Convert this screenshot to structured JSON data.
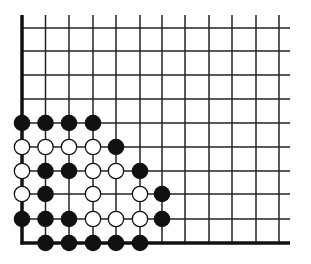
{
  "board": {
    "description": "Go board diagram, lower-left corner section",
    "columns": 12,
    "rows": 10,
    "col_x": [
      22,
      45.5,
      69,
      93,
      116,
      140,
      162,
      185,
      209,
      232,
      256,
      279
    ],
    "row_y": [
      28,
      51,
      75,
      99,
      123,
      147,
      171,
      194,
      219,
      243
    ],
    "line_top": 15,
    "line_right": 290,
    "edges": {
      "left": true,
      "bottom": true,
      "top": false,
      "right": false
    },
    "line_color": "#222222",
    "edge_color": "#111111",
    "stone_radius": 8.3
  },
  "stones": [
    {
      "color": "black",
      "col": 0,
      "row": 4
    },
    {
      "color": "black",
      "col": 1,
      "row": 4
    },
    {
      "color": "black",
      "col": 2,
      "row": 4
    },
    {
      "color": "black",
      "col": 3,
      "row": 4
    },
    {
      "color": "white",
      "col": 0,
      "row": 5
    },
    {
      "color": "white",
      "col": 1,
      "row": 5
    },
    {
      "color": "white",
      "col": 2,
      "row": 5
    },
    {
      "color": "white",
      "col": 3,
      "row": 5
    },
    {
      "color": "black",
      "col": 4,
      "row": 5
    },
    {
      "color": "white",
      "col": 0,
      "row": 6
    },
    {
      "color": "black",
      "col": 1,
      "row": 6
    },
    {
      "color": "black",
      "col": 2,
      "row": 6
    },
    {
      "color": "white",
      "col": 3,
      "row": 6
    },
    {
      "color": "white",
      "col": 4,
      "row": 6
    },
    {
      "color": "black",
      "col": 5,
      "row": 6
    },
    {
      "color": "white",
      "col": 0,
      "row": 7
    },
    {
      "color": "black",
      "col": 1,
      "row": 7
    },
    {
      "color": "white",
      "col": 3,
      "row": 7
    },
    {
      "color": "white",
      "col": 5,
      "row": 7
    },
    {
      "color": "black",
      "col": 6,
      "row": 7
    },
    {
      "color": "black",
      "col": 0,
      "row": 8
    },
    {
      "color": "black",
      "col": 1,
      "row": 8
    },
    {
      "color": "black",
      "col": 2,
      "row": 8
    },
    {
      "color": "white",
      "col": 3,
      "row": 8
    },
    {
      "color": "white",
      "col": 4,
      "row": 8
    },
    {
      "color": "white",
      "col": 5,
      "row": 8
    },
    {
      "color": "black",
      "col": 6,
      "row": 8
    },
    {
      "color": "black",
      "col": 1,
      "row": 9
    },
    {
      "color": "black",
      "col": 2,
      "row": 9
    },
    {
      "color": "black",
      "col": 3,
      "row": 9
    },
    {
      "color": "black",
      "col": 4,
      "row": 9
    },
    {
      "color": "black",
      "col": 5,
      "row": 9
    }
  ],
  "colors": {
    "black_stone": "#111111",
    "white_stone_fill": "#ffffff",
    "white_stone_stroke": "#111111",
    "background": "#ffffff"
  }
}
